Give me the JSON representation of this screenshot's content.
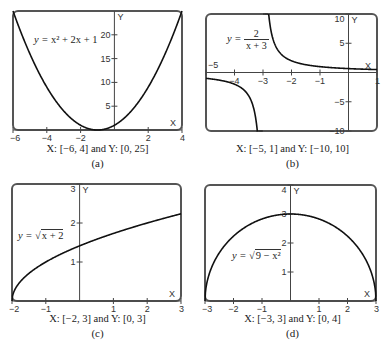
{
  "chart_data": [
    {
      "id": "a",
      "type": "line",
      "title": "y = x^2 + 2x + 1",
      "equation": {
        "lhs": "y = ",
        "expr": "x² + 2x + 1"
      },
      "function": "x*x + 2*x + 1",
      "xlim": [
        -6,
        4
      ],
      "ylim": [
        0,
        25
      ],
      "xticks": [
        -6,
        -4,
        -2,
        2,
        4
      ],
      "yticks": [
        5,
        10,
        15,
        20
      ],
      "xlabel": "X",
      "ylabel": "Y",
      "window_label": "X: [−6, 4]  and Y: [0, 25]",
      "panel_letter": "(a)",
      "box": {
        "left": 13,
        "top": 11,
        "right": 182,
        "bottom": 130
      },
      "grid": false
    },
    {
      "id": "b",
      "type": "line",
      "title": "y = 2/(x + 3)",
      "equation": {
        "lhs": "y = ",
        "num": "2",
        "den": "x + 3"
      },
      "function": "2/(x+3)",
      "asymptote_x": -3,
      "xlim": [
        -5,
        1
      ],
      "ylim": [
        -10,
        10
      ],
      "xticks": [
        -5,
        -4,
        -3,
        -2,
        -1,
        1
      ],
      "yticks": [
        -10,
        -5,
        5,
        10
      ],
      "xlabel": "X",
      "ylabel": "Y",
      "window_label": "X: [−5, 1] and Y: [−10, 10]",
      "panel_letter": "(b)",
      "box": {
        "left": 206,
        "top": 14,
        "right": 377,
        "bottom": 131
      },
      "grid": false
    },
    {
      "id": "c",
      "type": "line",
      "title": "y = sqrt(x + 2)",
      "equation": {
        "lhs": "y = √",
        "expr": "x + 2"
      },
      "function": "Math.sqrt(x+2)",
      "xlim": [
        -2,
        3
      ],
      "ylim": [
        0,
        3
      ],
      "xticks": [
        -2,
        -1,
        1,
        2,
        3
      ],
      "yticks": [
        1,
        2,
        3
      ],
      "xlabel": "X",
      "ylabel": "Y",
      "window_label": "X: [−2, 3]  and Y: [0, 3]",
      "panel_letter": "(c)",
      "box": {
        "left": 12,
        "top": 184,
        "right": 181,
        "bottom": 301
      },
      "grid": false
    },
    {
      "id": "d",
      "type": "line",
      "title": "y = sqrt(9 - x^2)",
      "equation": {
        "lhs": "y = √",
        "expr": "9 − x²"
      },
      "function": "Math.sqrt(9-x*x)",
      "xlim": [
        -3,
        3
      ],
      "ylim": [
        0,
        4
      ],
      "xticks": [
        -3,
        -2,
        -1,
        1,
        2,
        3
      ],
      "yticks": [
        1,
        2,
        3,
        4
      ],
      "xlabel": "X",
      "ylabel": "Y",
      "window_label": "X: [−3, 3] and Y: [0, 4]",
      "panel_letter": "(d)",
      "box": {
        "left": 205,
        "top": 185,
        "right": 376,
        "bottom": 301
      },
      "grid": false
    }
  ],
  "colors": {
    "frame": "#555555",
    "curve": "#111111",
    "axis": "#444444",
    "text": "#333333"
  }
}
